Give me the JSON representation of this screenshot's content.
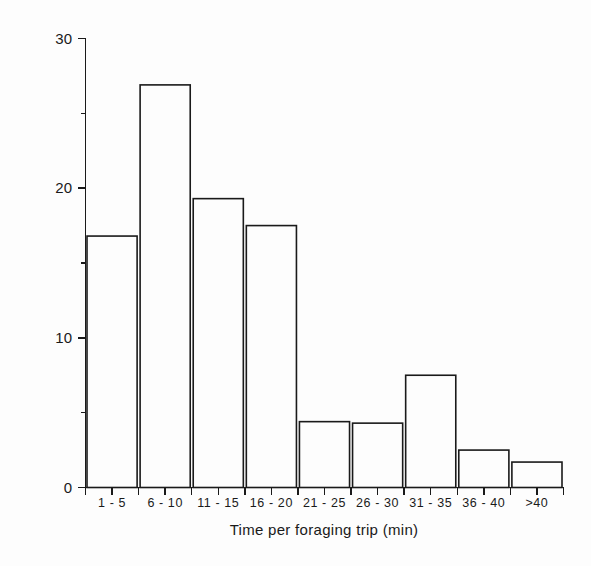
{
  "chart_data": {
    "type": "bar",
    "title": "",
    "subtitle": "",
    "xlabel": "Time per foraging trip (min)",
    "ylabel": "Per cent of observations",
    "categories": [
      "1 - 5",
      "6 - 10",
      "11 - 15",
      "16 - 20",
      "21 - 25",
      "26 - 30",
      "31 - 35",
      "36 - 40",
      ">40"
    ],
    "values": [
      16.8,
      26.9,
      19.3,
      17.5,
      4.4,
      4.3,
      7.5,
      2.5,
      1.7
    ],
    "ylim": [
      0,
      30
    ],
    "xlim_categories": 9,
    "y_major_ticks": [
      0,
      10,
      20,
      30
    ],
    "y_major_tick_labels": [
      "0",
      "10",
      "20",
      "30"
    ],
    "y_minor_ticks": [
      5,
      15,
      25
    ],
    "grid": false,
    "legend": null,
    "bar_style": {
      "fill": "none",
      "edge_color": "#1a1a1a",
      "edge_width": 1.6
    },
    "axis_color": "#1a1a1a",
    "background": "#fdfdfd"
  },
  "axes": {
    "y_title": "Per cent of observations",
    "x_title": "Time per foraging trip (min)"
  }
}
